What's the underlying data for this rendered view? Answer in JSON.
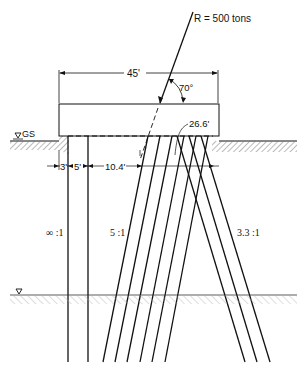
{
  "diagram": {
    "type": "pile-group-section",
    "resultant": {
      "label": "R = 500 tons",
      "angle_label": "70°"
    },
    "cap": {
      "width_label": "45'"
    },
    "ground_surface_label": "GS",
    "dimensions": {
      "d1": "3'",
      "d2": "5'",
      "d3": "10.4'",
      "d4": "26.6'"
    },
    "batter_labels": {
      "vertical": "∞ :1",
      "left_batter": "5 :1",
      "right_batter": "3.3 :1"
    },
    "colors": {
      "line": "#111111",
      "hatch": "#777777",
      "background": "#ffffff"
    }
  }
}
